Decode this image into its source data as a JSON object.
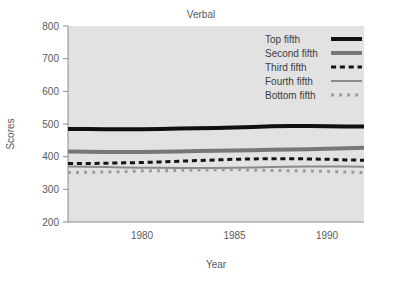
{
  "chart_data": {
    "type": "line",
    "title": "Verbal",
    "xlabel": "Year",
    "ylabel": "Scores",
    "xlim": [
      1976,
      1992
    ],
    "ylim": [
      200,
      800
    ],
    "xticks": [
      1980,
      1985,
      1990
    ],
    "xtick_labels": [
      "1980",
      "1985",
      "1990"
    ],
    "yticks": [
      200,
      300,
      400,
      500,
      600,
      700,
      800
    ],
    "ytick_labels": [
      "200",
      "300",
      "400",
      "500",
      "600",
      "700",
      "800"
    ],
    "grid": false,
    "legend_position": "top-right",
    "x": [
      1976,
      1977,
      1978,
      1979,
      1980,
      1981,
      1982,
      1983,
      1984,
      1985,
      1986,
      1987,
      1988,
      1989,
      1990,
      1991,
      1992
    ],
    "series": [
      {
        "name": "Top fifth",
        "color": "#101010",
        "style": "solid",
        "width": 4,
        "values": [
          485,
          485,
          484,
          484,
          484,
          485,
          486,
          487,
          488,
          489,
          491,
          493,
          494,
          494,
          493,
          492,
          492
        ]
      },
      {
        "name": "Second fifth",
        "color": "#777777",
        "style": "solid",
        "width": 4,
        "values": [
          416,
          415,
          414,
          414,
          414,
          415,
          416,
          417,
          418,
          419,
          420,
          421,
          422,
          423,
          424,
          426,
          427
        ]
      },
      {
        "name": "Third fifth",
        "color": "#151515",
        "style": "dashed",
        "width": 3,
        "values": [
          379,
          379,
          380,
          381,
          382,
          384,
          386,
          388,
          390,
          392,
          393,
          394,
          394,
          393,
          392,
          390,
          389
        ]
      },
      {
        "name": "Fourth fifth",
        "color": "#8a8a8a",
        "style": "solid",
        "width": 2,
        "values": [
          370,
          369,
          368,
          367,
          366,
          366,
          365,
          365,
          365,
          366,
          367,
          368,
          369,
          370,
          370,
          370,
          369
        ]
      },
      {
        "name": "Bottom fifth",
        "color": "#9a9a9a",
        "style": "dotted",
        "width": 3,
        "values": [
          351,
          352,
          353,
          354,
          356,
          357,
          358,
          359,
          360,
          360,
          359,
          358,
          357,
          356,
          355,
          353,
          351
        ]
      }
    ]
  },
  "legend": {
    "items": [
      {
        "label": "Top fifth"
      },
      {
        "label": "Second fifth"
      },
      {
        "label": "Third fifth"
      },
      {
        "label": "Fourth fifth"
      },
      {
        "label": "Bottom fifth"
      }
    ]
  },
  "colors": {
    "plot_background": "#e2e2e2",
    "page_background": "#ffffff",
    "axis": "#8c8c8c",
    "text": "#595959"
  }
}
